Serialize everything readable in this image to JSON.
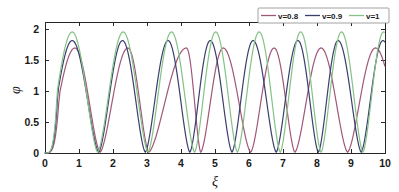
{
  "chart_data": {
    "type": "line",
    "title": "",
    "subtitle": "",
    "xlabel": "ξ",
    "ylabel": "φ",
    "xlim": [
      0,
      10
    ],
    "ylim": [
      0,
      2.12
    ],
    "xticks": [
      0,
      1,
      2,
      3,
      4,
      5,
      6,
      7,
      8,
      9,
      10
    ],
    "xticklabels": [
      "0",
      "1",
      "2",
      "3",
      "4",
      "5",
      "6",
      "7",
      "8",
      "9",
      "10"
    ],
    "yticks": [
      0,
      0.5,
      1,
      1.5,
      2
    ],
    "yticklabels": [
      "0",
      "0.5",
      "1",
      "1.5",
      "2"
    ],
    "grid": false,
    "legend_position": "top-right",
    "background": "#ffffff",
    "axis_color": "#262626",
    "series": [
      {
        "name": "v=0.8",
        "label": "v=0.8",
        "color": "#a05878",
        "amplitude": 1.7,
        "period": 1.78,
        "peak_offset": 0.88,
        "ramp_width": 0.42,
        "peaks_x": [
          0.88,
          2.44,
          4.16,
          5.24,
          6.74,
          8.12,
          9.72
        ],
        "minima_x": [
          1.62,
          3.05,
          4.58,
          6.05,
          7.35,
          8.9
        ]
      },
      {
        "name": "v=0.9",
        "label": "v=0.9",
        "color": "#3b3f6e",
        "amplitude": 1.82,
        "period": 1.32,
        "peak_offset": 0.8,
        "ramp_width": 0.38,
        "peaks_x": [
          0.8,
          2.28,
          3.62,
          4.86,
          6.12,
          7.44,
          8.62,
          9.94
        ],
        "minima_x": [
          1.58,
          2.95,
          4.26,
          5.5,
          6.8,
          8.04,
          9.3
        ]
      },
      {
        "name": "v=1",
        "label": "v=1",
        "color": "#86c287",
        "amplitude": 1.96,
        "period": 1.23,
        "peak_offset": 0.8,
        "ramp_width": 0.36,
        "peaks_x": [
          0.8,
          2.3,
          3.72,
          5.02,
          6.3,
          7.52,
          8.72,
          9.96
        ],
        "minima_x": [
          1.55,
          3.03,
          4.4,
          5.66,
          6.92,
          8.12,
          9.35
        ]
      }
    ]
  },
  "legend": {
    "entries": [
      {
        "label": "v=0.8",
        "color": "#a05878"
      },
      {
        "label": "v=0.9",
        "color": "#3b3f6e"
      },
      {
        "label": "v=1",
        "color": "#86c287"
      }
    ]
  },
  "axes": {
    "x_label": "ξ",
    "y_label": "φ"
  }
}
